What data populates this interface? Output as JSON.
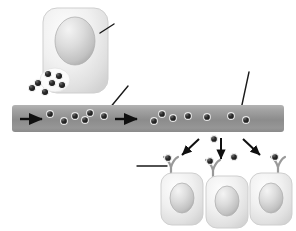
{
  "diagram": {
    "background_color": "#ffffff",
    "width": 296,
    "height": 231
  },
  "palette": {
    "cell_body_light": "#f2f2f2",
    "cell_body_mid": "#e3e3e3",
    "cell_body_edge": "#c9c9c9",
    "nucleus_light": "#e8e8e8",
    "nucleus_mid": "#cfcfcf",
    "nucleus_edge": "#a8a8a8",
    "vessel_top": "#a8a8a8",
    "vessel_mid": "#8e8e8e",
    "vessel_bottom": "#9b9b9b",
    "particle_dark": "#1f1f1f",
    "particle_rim": "#f0f0f0",
    "arrow_black": "#101010",
    "leader_line": "#1a1a1a",
    "receptor_stroke": "#8f8f8f",
    "vesicle_fill": "#fbfbfb"
  },
  "secreting_cell": {
    "name": "secreting-cell",
    "label": "",
    "x": 43,
    "y": 8,
    "width": 65,
    "height": 85,
    "nucleus": {
      "name": "secreting-cell-nucleus",
      "cx": 75,
      "cy": 41,
      "rx": 20,
      "ry": 24
    },
    "vesicle": {
      "name": "secretory-vesicle",
      "cx": 55,
      "cy": 80,
      "rx": 14,
      "ry": 11
    }
  },
  "leader_lines": [
    {
      "name": "leader-line-nucleus",
      "x1": 114,
      "y1": 24,
      "x2": 100,
      "y2": 33
    },
    {
      "name": "leader-line-signal-molecule",
      "x1": 128,
      "y1": 86,
      "x2": 104,
      "y2": 115
    },
    {
      "name": "leader-line-blood-vessel",
      "x1": 249,
      "y1": 72,
      "x2": 240,
      "y2": 114
    },
    {
      "name": "leader-line-receptor",
      "x1": 137,
      "y1": 166,
      "x2": 167,
      "y2": 166
    }
  ],
  "blood_vessel": {
    "name": "blood-vessel",
    "x": 12,
    "y": 105,
    "width": 272,
    "height": 27,
    "flow_arrows": [
      {
        "name": "flow-arrow-1",
        "x": 20,
        "y": 119,
        "length": 26
      },
      {
        "name": "flow-arrow-2",
        "x": 115,
        "y": 119,
        "length": 26
      }
    ],
    "particles": [
      {
        "cx": 50,
        "cy": 114
      },
      {
        "cx": 64,
        "cy": 121
      },
      {
        "cx": 75,
        "cy": 116
      },
      {
        "cx": 85,
        "cy": 119
      },
      {
        "cx": 88,
        "cy": 113
      },
      {
        "cx": 104,
        "cy": 116
      },
      {
        "cx": 154,
        "cy": 121
      },
      {
        "cx": 162,
        "cy": 114
      },
      {
        "cx": 173,
        "cy": 118
      },
      {
        "cx": 188,
        "cy": 116
      },
      {
        "cx": 207,
        "cy": 117
      },
      {
        "cx": 231,
        "cy": 116
      },
      {
        "cx": 246,
        "cy": 120
      }
    ]
  },
  "diffusion_arrows": [
    {
      "name": "diffusion-arrow-left",
      "x1": 199,
      "y1": 139,
      "x2": 180,
      "y2": 157
    },
    {
      "name": "diffusion-arrow-center",
      "x1": 221,
      "y1": 138,
      "x2": 221,
      "y2": 161
    },
    {
      "name": "diffusion-arrow-right",
      "x1": 243,
      "y1": 139,
      "x2": 262,
      "y2": 157
    }
  ],
  "free_particles": [
    {
      "name": "free-signal-molecule-1",
      "cx": 214,
      "cy": 139
    },
    {
      "name": "free-signal-molecule-2",
      "cx": 234,
      "cy": 157
    }
  ],
  "target_cells": [
    {
      "name": "target-cell-left",
      "x": 161,
      "y": 173,
      "width": 42,
      "height": 52,
      "nucleus": {
        "cx": 182,
        "cy": 198,
        "rx": 12,
        "ry": 15
      },
      "receptor": {
        "stem_x": 171,
        "stem_top": 162,
        "stem_bottom": 176
      },
      "bound_particle": {
        "cx": 168,
        "cy": 160
      }
    },
    {
      "name": "target-cell-center",
      "x": 206,
      "y": 176,
      "width": 42,
      "height": 52,
      "nucleus": {
        "cx": 227,
        "cy": 201,
        "rx": 12,
        "ry": 15
      },
      "receptor": {
        "stem_x": 213,
        "stem_top": 165,
        "stem_bottom": 179
      },
      "bound_particle": {
        "cx": 211,
        "cy": 162
      }
    },
    {
      "name": "target-cell-right",
      "x": 250,
      "y": 173,
      "width": 42,
      "height": 52,
      "nucleus": {
        "cx": 271,
        "cy": 198,
        "rx": 12,
        "ry": 15
      },
      "receptor": {
        "stem_x": 278,
        "stem_top": 162,
        "stem_bottom": 176
      },
      "bound_particle": {
        "cx": 275,
        "cy": 158
      }
    }
  ],
  "vesicle_particles": [
    {
      "cx": 48,
      "cy": 74
    },
    {
      "cx": 59,
      "cy": 76
    },
    {
      "cx": 52,
      "cy": 83
    },
    {
      "cx": 62,
      "cy": 85
    },
    {
      "cx": 38,
      "cy": 83
    },
    {
      "cx": 32,
      "cy": 88
    },
    {
      "cx": 45,
      "cy": 92
    }
  ]
}
